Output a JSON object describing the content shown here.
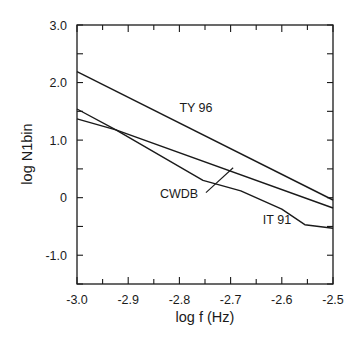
{
  "chart_data": {
    "type": "line",
    "title": "",
    "xlabel": "log f (Hz)",
    "ylabel": "log N1bin",
    "xlim": [
      -3.0,
      -2.5
    ],
    "ylim": [
      -1.5,
      3.0
    ],
    "grid": false,
    "xticks": [
      -3.0,
      -2.9,
      -2.8,
      -2.7,
      -2.6,
      -2.5
    ],
    "xtick_labels": [
      "-3.0",
      "-2.9",
      "-2.8",
      "-2.7",
      "-2.6",
      "-2.5"
    ],
    "x_minor_step": 0.05,
    "yticks": [
      3.0,
      2.0,
      1.0,
      0,
      -1.0
    ],
    "ytick_labels": [
      "3.0",
      "2.0",
      "1.0",
      "0",
      "-1.0"
    ],
    "y_minor_step": 0.5,
    "series": [
      {
        "name": "TY 96",
        "points": [
          [
            -3.0,
            2.19
          ],
          [
            -2.5,
            -0.04
          ]
        ]
      },
      {
        "name": "CWDB",
        "points": [
          [
            -3.0,
            1.37
          ],
          [
            -2.924,
            1.18
          ],
          [
            -2.5,
            -0.18
          ]
        ]
      },
      {
        "name": "IT 91",
        "points": [
          [
            -3.0,
            1.54
          ],
          [
            -2.924,
            1.18
          ],
          [
            -2.754,
            0.3
          ],
          [
            -2.68,
            0.12
          ],
          [
            -2.6,
            -0.2
          ],
          [
            -2.555,
            -0.47
          ],
          [
            -2.5,
            -0.53
          ]
        ]
      }
    ],
    "annotations": [
      {
        "text": "TY 96",
        "series": "TY 96",
        "anchor": [
          -2.8,
          1.48
        ]
      },
      {
        "text": "CWDB",
        "series": "CWDB",
        "anchor": [
          -2.838,
          0.0
        ],
        "leader_to": [
          -2.695,
          0.52
        ]
      },
      {
        "text": "IT 91",
        "series": "IT 91",
        "anchor": [
          -2.637,
          -0.45
        ]
      }
    ]
  }
}
